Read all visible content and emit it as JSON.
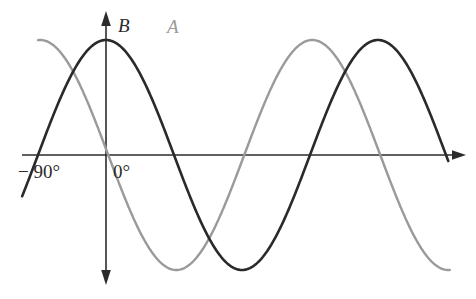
{
  "figure": {
    "background_color": "#ffffff",
    "width": 476,
    "height": 299
  },
  "axes": {
    "x_axis_name": "horizontal-axis",
    "y_axis_name": "vertical-axis",
    "x_axis_color": "#2b2b2b",
    "y_axis_color": "#2b2b2b",
    "x_tick_labels": [
      {
        "text": "− 90°",
        "x_px": 18,
        "y_px": 178
      },
      {
        "text": "0°",
        "x_px": 113,
        "y_px": 178
      }
    ]
  },
  "labels": {
    "series_b": {
      "text": "B",
      "color": "#2b2b2b",
      "x_px": 118,
      "y_px": 32
    },
    "series_a": {
      "text": "A",
      "color": "#9a9a9a",
      "x_px": 167,
      "y_px": 33
    }
  },
  "chart_data": {
    "type": "line",
    "title": "",
    "xlabel": "",
    "ylabel": "",
    "grid": false,
    "legend": "inline-curve-labels",
    "xlim": [
      -135,
      340
    ],
    "ylim": [
      -1.25,
      1.25
    ],
    "x_unit": "degrees",
    "x_tick_values": [
      -90,
      0
    ],
    "x_tick_labels": [
      "− 90°",
      "0°"
    ],
    "series": [
      {
        "name": "B",
        "color": "#2a2a2a",
        "stroke_width": 2.6,
        "form": "cosine",
        "amplitude": 1.0,
        "period_degrees": 360,
        "phase_degrees": 0,
        "peak_x_degrees": [
          0,
          360
        ],
        "trough_x_degrees": [
          180
        ],
        "zero_crossings_degrees": [
          -90,
          90,
          270
        ],
        "x_start_degrees": -111,
        "x_end_degrees": 453,
        "x": [
          -111,
          -90,
          -45,
          0,
          45,
          90,
          135,
          180,
          225,
          270,
          315,
          360,
          405,
          453
        ],
        "y": [
          -0.31,
          0,
          0.707,
          1.0,
          0.707,
          0,
          -0.707,
          -1.0,
          -0.707,
          0,
          0.707,
          1.0,
          0.707,
          -0.08
        ]
      },
      {
        "name": "A",
        "color": "#9a9a9a",
        "stroke_width": 2.4,
        "form": "cosine",
        "amplitude": 1.0,
        "period_degrees": 360,
        "phase_degrees": -87,
        "peak_x_degrees": [
          87,
          447
        ],
        "trough_x_degrees": [
          -93,
          267
        ],
        "zero_crossings_degrees": [
          -3,
          177,
          357
        ],
        "x_start_degrees": -90,
        "x_end_degrees": 455,
        "x": [
          -90,
          -3,
          87,
          177,
          267,
          357,
          447,
          455
        ],
        "y": [
          -0.999,
          0,
          1.0,
          0,
          -1.0,
          0,
          1.0,
          0.99
        ]
      }
    ]
  }
}
